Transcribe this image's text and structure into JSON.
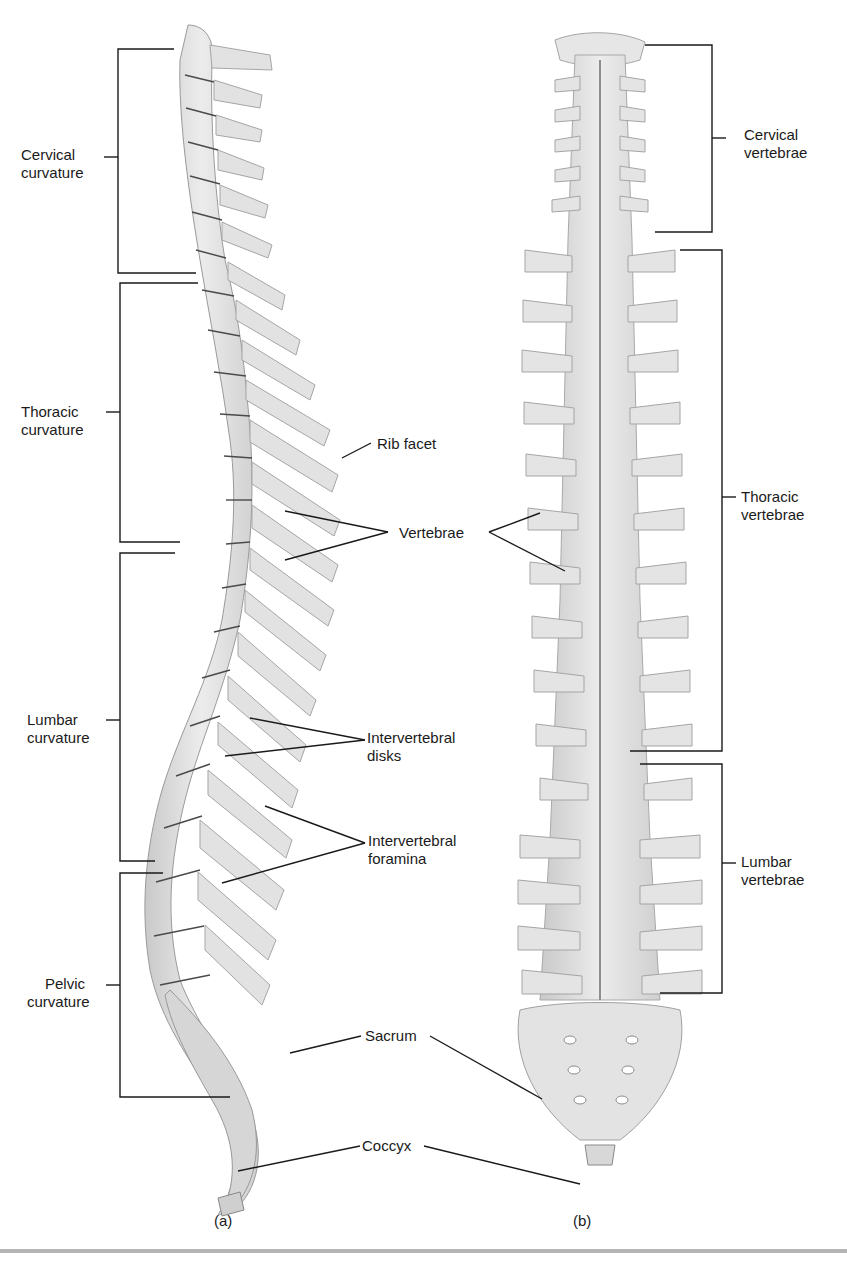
{
  "figure": {
    "panels": [
      {
        "id": "a",
        "caption": "(a)",
        "view": "lateral"
      },
      {
        "id": "b",
        "caption": "(b)",
        "view": "posterior"
      }
    ],
    "left_regions": [
      {
        "line1": "Cervical",
        "line2": "curvature"
      },
      {
        "line1": "Thoracic",
        "line2": "curvature"
      },
      {
        "line1": "Lumbar",
        "line2": "curvature"
      },
      {
        "line1": "Pelvic",
        "line2": "curvature"
      }
    ],
    "right_regions": [
      {
        "line1": "Cervical",
        "line2": "vertebrae"
      },
      {
        "line1": "Thoracic",
        "line2": "vertebrae"
      },
      {
        "line1": "Lumbar",
        "line2": "vertebrae"
      }
    ],
    "callouts": {
      "rib_facet": "Rib facet",
      "vertebrae": "Vertebrae",
      "intervertebral_disks_1": "Intervertebral",
      "intervertebral_disks_2": "disks",
      "intervertebral_foramina_1": "Intervertebral",
      "intervertebral_foramina_2": "foramina",
      "sacrum": "Sacrum",
      "coccyx": "Coccyx"
    },
    "colors": {
      "bone": "#e4e4e4",
      "bone_shade": "#bdbdbd",
      "line": "#1a1a1a",
      "rule": "#b5b5b5"
    }
  }
}
